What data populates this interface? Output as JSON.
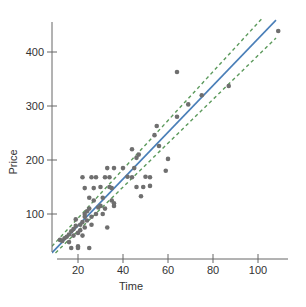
{
  "chart_data": {
    "type": "scatter",
    "title": "",
    "xlabel": "Time",
    "ylabel": "Price",
    "xlim": [
      8,
      112
    ],
    "ylim": [
      28,
      440
    ],
    "x_ticks": [
      20,
      40,
      60,
      80,
      100
    ],
    "y_ticks": [
      100,
      200,
      300,
      400
    ],
    "grid": false,
    "legend": null,
    "colors": {
      "points": "#6f6f6f",
      "fit_line": "#4a7fb8",
      "band_lines": "#5c9a5c",
      "axes": "#666666",
      "text": "#333333"
    },
    "series": [
      {
        "name": "observations",
        "kind": "points",
        "points": [
          [
            12,
            52
          ],
          [
            13,
            50
          ],
          [
            14,
            55
          ],
          [
            15,
            58
          ],
          [
            16,
            48
          ],
          [
            17,
            37
          ],
          [
            16,
            62
          ],
          [
            17,
            68
          ],
          [
            18,
            72
          ],
          [
            18,
            60
          ],
          [
            19,
            78
          ],
          [
            19,
            90
          ],
          [
            20,
            40
          ],
          [
            20,
            37
          ],
          [
            20,
            65
          ],
          [
            21,
            70
          ],
          [
            21,
            80
          ],
          [
            22,
            60
          ],
          [
            22,
            85
          ],
          [
            23,
            95
          ],
          [
            23,
            75
          ],
          [
            24,
            105
          ],
          [
            24,
            88
          ],
          [
            25,
            37
          ],
          [
            23,
            100
          ],
          [
            25,
            110
          ],
          [
            26,
            95
          ],
          [
            26,
            80
          ],
          [
            27,
            125
          ],
          [
            28,
            100
          ],
          [
            22,
            168
          ],
          [
            26,
            168
          ],
          [
            23,
            148
          ],
          [
            27,
            148
          ],
          [
            25,
            130
          ],
          [
            28,
            168
          ],
          [
            30,
            150
          ],
          [
            31,
            130
          ],
          [
            32,
            110
          ],
          [
            33,
            75
          ],
          [
            30,
            115
          ],
          [
            31,
            100
          ],
          [
            33,
            185
          ],
          [
            36,
            185
          ],
          [
            34,
            168
          ],
          [
            35,
            148
          ],
          [
            35,
            125
          ],
          [
            36,
            120
          ],
          [
            32,
            168
          ],
          [
            34,
            150
          ],
          [
            29,
            112
          ],
          [
            36,
            115
          ],
          [
            44,
            220
          ],
          [
            46,
            204
          ],
          [
            47,
            210
          ],
          [
            40,
            185
          ],
          [
            42,
            169
          ],
          [
            44,
            168
          ],
          [
            50,
            169
          ],
          [
            52,
            152
          ],
          [
            45,
            185
          ],
          [
            46,
            150
          ],
          [
            48,
            133
          ],
          [
            49,
            150
          ],
          [
            52,
            168
          ],
          [
            54,
            246
          ],
          [
            56,
            226
          ],
          [
            55,
            263
          ],
          [
            59,
            180
          ],
          [
            60,
            202
          ],
          [
            64,
            363
          ],
          [
            64,
            280
          ],
          [
            69,
            303
          ],
          [
            75,
            320
          ],
          [
            87,
            337
          ],
          [
            109,
            439
          ]
        ]
      },
      {
        "name": "fitted line",
        "kind": "line",
        "style": "solid",
        "x": [
          8.4,
          108
        ],
        "y": [
          28,
          459
        ]
      },
      {
        "name": "upper band",
        "kind": "line",
        "style": "dashed",
        "x": [
          8.4,
          102
        ],
        "y": [
          40,
          463
        ]
      },
      {
        "name": "lower band",
        "kind": "line",
        "style": "dashed",
        "x": [
          10,
          108
        ],
        "y": [
          28,
          426
        ]
      }
    ]
  },
  "axes": {
    "x_title": "Time",
    "y_title": "Price"
  }
}
